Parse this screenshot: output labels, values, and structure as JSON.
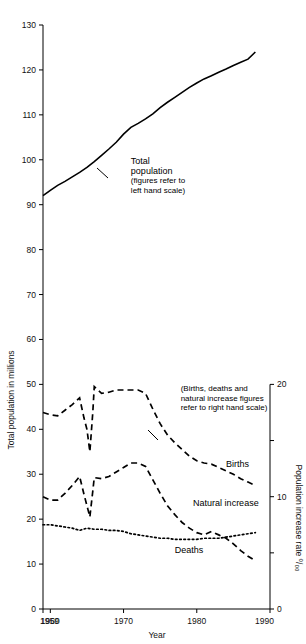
{
  "chart_data": {
    "type": "line",
    "title": "",
    "xlabel": "Year",
    "ylabel": "Total population in millions",
    "ylabel_right": "Population increase rate ⁰/₀₀",
    "xlim": [
      1959,
      1990
    ],
    "ylim": [
      0,
      130
    ],
    "ylim_right": [
      0,
      20
    ],
    "grid": false,
    "legend": "inline-annotations",
    "xticks": [
      1959,
      1960,
      1970,
      1980,
      1990
    ],
    "xtick_labels": [
      "1959",
      "1960",
      "1970",
      "1980",
      "1990"
    ],
    "yticks": [
      0,
      10,
      20,
      30,
      40,
      50,
      60,
      70,
      80,
      90,
      100,
      110,
      120,
      130
    ],
    "ytick_labels": [
      "0",
      "10",
      "20",
      "30",
      "40",
      "50",
      "60",
      "70",
      "80",
      "90",
      "100",
      "110",
      "120",
      "130"
    ],
    "yticks_right": [
      0,
      5,
      10,
      15,
      20
    ],
    "ytick_labels_right": [
      "0",
      "",
      "10",
      "",
      "20"
    ],
    "annotations": [
      {
        "name": "total-population-note",
        "lines": [
          "Total",
          "population",
          "(figures refer to",
          "left hand scale)"
        ],
        "x": 1971.0,
        "y": 99.0
      },
      {
        "name": "right-scale-note",
        "lines": [
          "(Births, deaths and",
          "natural increase figures",
          "refer to right hand scale)"
        ],
        "x": 1977.8,
        "y": 48.5
      }
    ],
    "series": [
      {
        "name": "Total population",
        "label": "Total population",
        "axis": "left",
        "style": "solid",
        "unit": "millions",
        "x": [
          1959,
          1960,
          1961,
          1962,
          1963,
          1964,
          1965,
          1966,
          1967,
          1968,
          1969,
          1970,
          1971,
          1972,
          1973,
          1974,
          1975,
          1976,
          1977,
          1978,
          1979,
          1980,
          1981,
          1982,
          1983,
          1984,
          1985,
          1986,
          1987,
          1988
        ],
        "values": [
          92.0,
          93.2,
          94.3,
          95.2,
          96.2,
          97.2,
          98.3,
          99.6,
          101.0,
          102.4,
          103.9,
          105.7,
          107.2,
          108.1,
          109.1,
          110.2,
          111.6,
          112.8,
          113.9,
          115.0,
          116.1,
          117.1,
          118.0,
          118.7,
          119.5,
          120.2,
          121.0,
          121.7,
          122.4,
          124.0
        ]
      },
      {
        "name": "Births",
        "label": "Births",
        "axis": "right",
        "style": "dashed",
        "unit": "per mille",
        "x": [
          1959,
          1960,
          1961,
          1962,
          1963,
          1964,
          1964.6,
          1965,
          1965.4,
          1965.8,
          1966,
          1967,
          1968,
          1969,
          1970,
          1971,
          1972,
          1973,
          1974,
          1975,
          1976,
          1977,
          1978,
          1979,
          1980,
          1981,
          1982,
          1983,
          1984,
          1985,
          1986,
          1987,
          1988
        ],
        "values": [
          17.5,
          17.3,
          17.2,
          17.7,
          18.2,
          18.8,
          17.0,
          16.0,
          14.0,
          17.5,
          19.8,
          19.2,
          19.3,
          19.5,
          19.5,
          19.5,
          19.5,
          19.2,
          17.8,
          16.5,
          15.5,
          14.8,
          14.2,
          13.6,
          13.2,
          13.0,
          12.9,
          12.6,
          12.3,
          12.0,
          11.6,
          11.3,
          11.0
        ]
      },
      {
        "name": "Natural increase",
        "label": "Natural increase",
        "axis": "right",
        "style": "dashed",
        "unit": "per mille",
        "x": [
          1959,
          1960,
          1961,
          1962,
          1963,
          1964,
          1964.6,
          1965,
          1965.4,
          1965.8,
          1966,
          1967,
          1968,
          1969,
          1970,
          1971,
          1972,
          1973,
          1974,
          1975,
          1976,
          1977,
          1978,
          1979,
          1980,
          1981,
          1982,
          1983,
          1984,
          1985,
          1986,
          1987,
          1988
        ],
        "values": [
          10.0,
          9.7,
          9.7,
          10.3,
          11.0,
          11.8,
          10.2,
          9.2,
          8.2,
          10.5,
          11.7,
          11.6,
          11.8,
          12.2,
          12.6,
          13.0,
          13.0,
          12.7,
          11.5,
          10.3,
          9.2,
          8.4,
          7.7,
          7.2,
          6.8,
          6.6,
          6.9,
          6.6,
          6.3,
          5.8,
          5.2,
          4.7,
          4.3
        ]
      },
      {
        "name": "Deaths",
        "label": "Deaths",
        "axis": "right",
        "style": "dotted",
        "unit": "per mille",
        "x": [
          1959,
          1960,
          1961,
          1962,
          1963,
          1964,
          1965,
          1966,
          1967,
          1968,
          1969,
          1970,
          1971,
          1972,
          1973,
          1974,
          1975,
          1976,
          1977,
          1978,
          1979,
          1980,
          1981,
          1982,
          1983,
          1984,
          1985,
          1986,
          1987,
          1988
        ],
        "values": [
          7.5,
          7.5,
          7.4,
          7.3,
          7.2,
          7.0,
          7.2,
          7.1,
          7.1,
          7.0,
          7.0,
          6.9,
          6.7,
          6.6,
          6.5,
          6.4,
          6.3,
          6.3,
          6.2,
          6.2,
          6.2,
          6.2,
          6.3,
          6.3,
          6.3,
          6.4,
          6.5,
          6.6,
          6.7,
          6.8
        ]
      }
    ],
    "series_labels": [
      {
        "name": "births-label",
        "text": "Births",
        "x": 1984.0,
        "y": 12.6
      },
      {
        "name": "natural-increase-label",
        "text": "Natural increase",
        "x": 1979.5,
        "y": 9.2
      },
      {
        "name": "deaths-label",
        "text": "Deaths",
        "x": 1977.0,
        "y": 5.0
      }
    ]
  }
}
